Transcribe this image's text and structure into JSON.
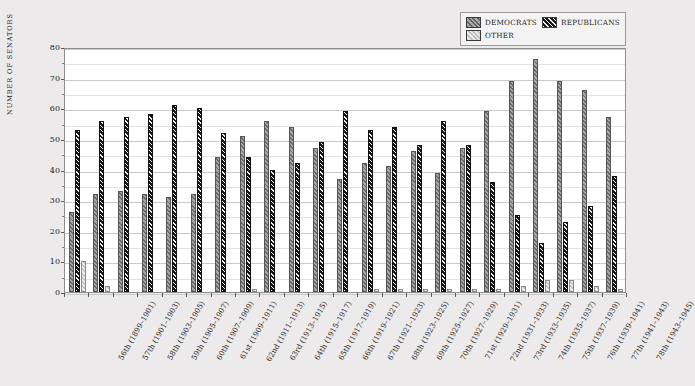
{
  "chart_data": {
    "type": "bar",
    "title": "",
    "xlabel": "",
    "ylabel": "NUMBER OF SENATORS",
    "ylim": [
      0,
      80
    ],
    "ytick_step": 10,
    "yminor_step": 5,
    "grid": true,
    "legend_position": "top-right",
    "categories": [
      "56th (1899–1901)",
      "57th (1901–1903)",
      "58th (1903–1905)",
      "59th (1905–1907)",
      "60th (1907–1909)",
      "61st (1909–1911)",
      "62nd (1911–1913)",
      "63rd (1913–1915)",
      "64th (1915–1917)",
      "65th (1917–1919)",
      "66th (1919–1921)",
      "67th (1921–1923)",
      "68th (1923–1925)",
      "69th (1925–1927)",
      "70th (1927–1929)",
      "71st (1929–1931)",
      "72nd (1931–1933)",
      "73rd (1933–1935)",
      "74th (1935–1937)",
      "75th (1937–1939)",
      "76th (1939–1941)",
      "77th (1941–1943)",
      "78th (1943–1945)"
    ],
    "yticks": [
      0,
      10,
      20,
      30,
      40,
      50,
      60,
      70,
      80
    ],
    "series": [
      {
        "name": "DEMOCRATS",
        "color": "#7d7d7d",
        "values": [
          26,
          32,
          33,
          32,
          31,
          32,
          44,
          51,
          56,
          54,
          47,
          37,
          42,
          41,
          46,
          39,
          47,
          59,
          69,
          76,
          69,
          66,
          57
        ]
      },
      {
        "name": "REPUBLICANS",
        "color": "#1c1c1c",
        "values": [
          53,
          56,
          57,
          58,
          61,
          60,
          52,
          44,
          40,
          42,
          49,
          59,
          53,
          54,
          48,
          56,
          48,
          36,
          25,
          16,
          23,
          28,
          38
        ]
      },
      {
        "name": "OTHER",
        "color": "#d2d2d2",
        "values": [
          10,
          2,
          0,
          0,
          0,
          0,
          0,
          1,
          0,
          0,
          0,
          0,
          1,
          1,
          1,
          1,
          1,
          1,
          2,
          4,
          4,
          2,
          1
        ]
      }
    ]
  },
  "legend": {
    "items": [
      {
        "label": "DEMOCRATS",
        "swatch": "democrats-swatch"
      },
      {
        "label": "REPUBLICANS",
        "swatch": "republicans-swatch"
      },
      {
        "label": "OTHER",
        "swatch": "other-swatch"
      }
    ]
  },
  "axis": {
    "y_title": "NUMBER OF SENATORS"
  }
}
